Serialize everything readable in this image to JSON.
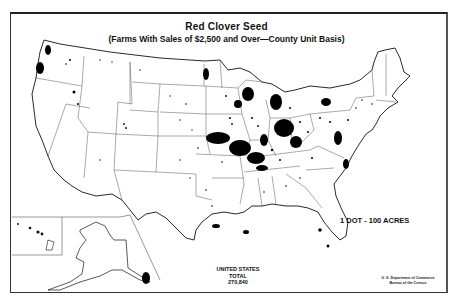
{
  "map": {
    "title": "Red Clover Seed",
    "subtitle": "(Farms With Sales of $2,500 and Over—County Unit Basis)",
    "legend": "1 DOT - 100 ACRES",
    "total": {
      "line1": "UNITED STATES",
      "line2": "TOTAL",
      "value": "270,840"
    },
    "source": {
      "line1": "U. S. Department of Commerce",
      "line2": "Bureau of the Census"
    },
    "colors": {
      "background": "#ffffff",
      "ink": "#111111",
      "state_lines": "#555555"
    },
    "insets": [
      "Alaska",
      "Hawaii"
    ]
  }
}
